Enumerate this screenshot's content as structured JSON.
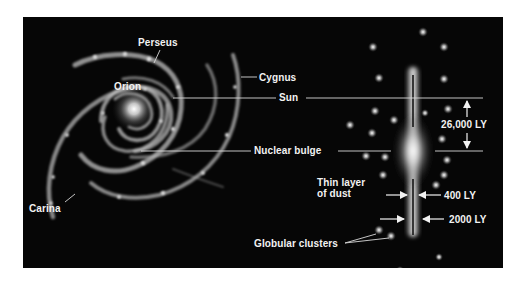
{
  "diagram": {
    "background_color": "#060606",
    "label_color": "#f2f2f2",
    "face_on_view": {
      "spiral_arms": [
        "Perseus",
        "Orion",
        "Cygnus",
        "Carina"
      ],
      "labels": {
        "perseus": "Perseus",
        "orion": "Orion",
        "cygnus": "Cygnus",
        "carina": "Carina"
      }
    },
    "edge_on_view": {
      "labels": {
        "sun": "Sun",
        "nuclear_bulge": "Nuclear bulge",
        "thin_layer_line1": "Thin layer",
        "thin_layer_line2": "of dust",
        "globular_clusters": "Globular clusters"
      },
      "dimensions": {
        "sun_to_center": "26,000 LY",
        "dust_layer_thickness": "400 LY",
        "disk_thickness": "2000 LY"
      }
    }
  }
}
